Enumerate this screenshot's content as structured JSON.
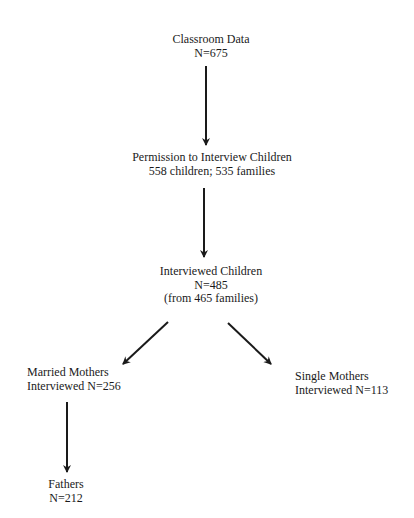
{
  "diagram": {
    "type": "flowchart",
    "nodes": [
      {
        "id": "classroom",
        "lines": [
          "Classroom Data",
          "N=675"
        ]
      },
      {
        "id": "permission",
        "lines": [
          "Permission to Interview Children",
          "558 children; 535 families"
        ]
      },
      {
        "id": "interviewed",
        "lines": [
          "Interviewed Children",
          "N=485",
          "(from 465 families)"
        ]
      },
      {
        "id": "married",
        "lines": [
          "Married Mothers",
          "Interviewed N=256"
        ]
      },
      {
        "id": "single",
        "lines": [
          "Single Mothers",
          "Interviewed N=113"
        ]
      },
      {
        "id": "fathers",
        "lines": [
          "Fathers",
          "N=212"
        ]
      }
    ],
    "edges": [
      {
        "from": "classroom",
        "to": "permission"
      },
      {
        "from": "permission",
        "to": "interviewed"
      },
      {
        "from": "interviewed",
        "to": "married"
      },
      {
        "from": "interviewed",
        "to": "single"
      },
      {
        "from": "married",
        "to": "fathers"
      }
    ],
    "colors": {
      "text": "#1a1a1a",
      "arrow": "#1a1a1a",
      "background": "#ffffff"
    }
  }
}
